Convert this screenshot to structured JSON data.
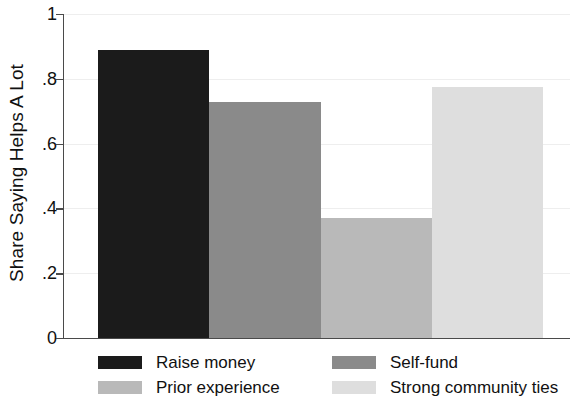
{
  "chart_data": {
    "type": "bar",
    "title": "",
    "xlabel": "",
    "ylabel": "Share Saying Helps A Lot",
    "ylim": [
      0,
      1
    ],
    "grid": true,
    "legend_position": "bottom",
    "categories": [
      "Raise money",
      "Self-fund",
      "Prior experience",
      "Strong community ties"
    ],
    "values": [
      0.888,
      0.728,
      0.369,
      0.775
    ],
    "colors": [
      "#1b1b1b",
      "#8a8a8a",
      "#b9b9b9",
      "#dedede"
    ],
    "yticks": [
      {
        "value": 1,
        "label": "1"
      },
      {
        "value": 0.8,
        "label": ".8"
      },
      {
        "value": 0.6,
        "label": ".6"
      },
      {
        "value": 0.4,
        "label": ".4"
      },
      {
        "value": 0.2,
        "label": ".2"
      },
      {
        "value": 0,
        "label": "0"
      }
    ],
    "legend": [
      {
        "label": "Raise money",
        "color": "#1b1b1b"
      },
      {
        "label": "Self-fund",
        "color": "#8a8a8a"
      },
      {
        "label": "Prior experience",
        "color": "#b9b9b9"
      },
      {
        "label": "Strong community ties",
        "color": "#dedede"
      }
    ]
  },
  "axis": {
    "line_color": "#4a4a4a",
    "grid_color": "#eeeeee"
  }
}
